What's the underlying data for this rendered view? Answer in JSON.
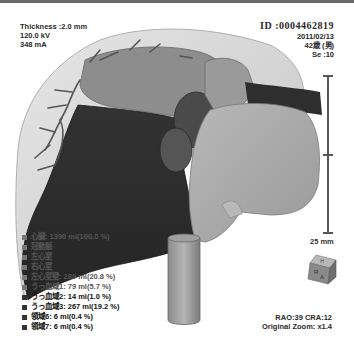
{
  "viewer": {
    "top_left": {
      "thickness": "Thickness :2.0 mm",
      "kv": "120.0 kV",
      "ma": "348 mA"
    },
    "top_right": {
      "patient_id": "ID :0004462819",
      "date": "2011/02/13",
      "age_sex": "42歳 (男)",
      "series": "Se :10"
    },
    "bottom_right": {
      "angles": "RAO:39 CRA:12",
      "zoom": "Original Zoom: x1.4"
    },
    "scale_bar": {
      "label": "25 mm"
    },
    "orientation_cube": {
      "top": "H",
      "left": "R",
      "front": "A"
    },
    "legend": [
      {
        "label": "心臓: 1390 ml(100.0 %)",
        "dim": true
      },
      {
        "label": "冠動脈",
        "dim": true
      },
      {
        "label": "左心室",
        "dim": true
      },
      {
        "label": "右心室",
        "dim": true
      },
      {
        "label": "左心室壁: 289 ml(20.8 %)",
        "dim": true
      },
      {
        "label": "うっ血域1: 79 ml(5.7 %)",
        "dim": true
      },
      {
        "label": "うっ血域2: 14 ml(1.0 %)",
        "dim": false
      },
      {
        "label": "うっ血域3: 267 ml(19.2 %)",
        "dim": false
      },
      {
        "label": "領域6: 6 ml(0.4 %)",
        "dim": false
      },
      {
        "label": "領域7: 6 ml(0.4 %)",
        "dim": false
      }
    ],
    "colors": {
      "background": "#ffffff",
      "dark_chamber": "#2b2b2b",
      "mid_chamber": "#8a8a8a",
      "light_chamber": "#a8a8a8",
      "pericardium": "#d8d8d8",
      "vessels": "#5a5a5a"
    }
  }
}
